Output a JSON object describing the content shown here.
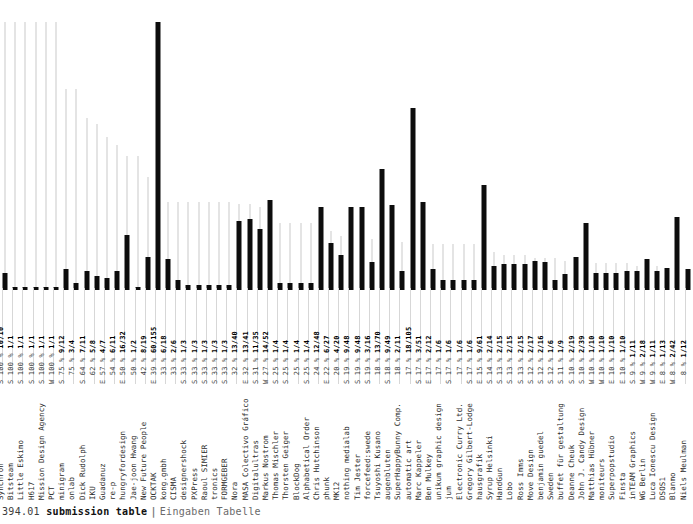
{
  "caption": {
    "number": "394.01",
    "title_en": "submission table",
    "separator": "|",
    "title_de": "Eingaben Tabelle"
  },
  "colors": {
    "bar_absolute": "#0d0d0d",
    "bar_percent": "#c9c9c9",
    "background": "#ffffff",
    "text": "#2b2b2b"
  },
  "chart_data": {
    "type": "bar",
    "xlabel": "",
    "ylabel": "",
    "grid": false,
    "legend": "none",
    "ylim_percent": [
      0,
      100
    ],
    "ylim_absolute": [
      0,
      155
    ],
    "series": [
      {
        "name": "acceptance percent",
        "unit": "%",
        "color": "#c9c9c9"
      },
      {
        "name": "submissions total",
        "unit": "count",
        "color": "#0d0d0d"
      }
    ],
    "categories": [
      "Synchron",
      "Bitsteam",
      "Little Eskimo",
      "H617",
      "Mission Design Agency",
      "PCT",
      "minigram",
      "onlab",
      "Dick Rudolph",
      "IKU",
      "Guadanuz",
      "re-p",
      "hungryfordesign",
      "Jae-joon Hwang",
      "New Future People",
      "OCKTAK",
      "kong.gmbh",
      "CISMA",
      "designershock",
      "PXPress",
      "Raoul SIMIER",
      "tronics",
      "FORMGEBER",
      "Nora",
      "MASA Colectivo Gráfico",
      "Digitalultras",
      "Markus Nostrom",
      "Thomas Mischler",
      "Thorsten Geiger",
      "BlockDog",
      "Alphabetical Order",
      "Chris Hutchinson",
      "phunk",
      "MK12",
      "nothing medialab",
      "Tim Jester",
      "forcefeed:swede",
      "Tsuyoshi Kusano",
      "augenbluten",
      "SuperHappyBunny Comp.",
      "automatic art",
      "Marc Kappeler",
      "Ben Mulkey",
      "unikum graphic design",
      "jum",
      "Electronic Curry Ltd.",
      "Gregory Gilbert-Lodge",
      "hausgrafik",
      "Syrup Helsinki",
      "HandGun",
      "Lobo",
      "Ross Imms",
      "Move Design",
      "benjamin guedel",
      "Sweden",
      "buffet für gestaltung",
      "Deanne Cheuk",
      "John J. Candy Design",
      "Matthias Hübner",
      "moniteurs",
      "Superpopstudio",
      "Finsta",
      "inTEAM Graphics",
      "WG Berlin",
      "Luca Ionescu Design",
      "DSOS1",
      "Blanmo",
      "Niels Meulman"
    ],
    "region": [
      "S",
      "S",
      "S",
      "S",
      "S",
      "W",
      "S",
      "",
      "S",
      "",
      "E",
      "",
      "E",
      "",
      "",
      "E",
      "",
      "",
      "S",
      "S",
      "S",
      "S",
      "",
      "E",
      "E",
      "S",
      "W",
      "S",
      "S",
      "",
      "E",
      "",
      "E",
      "S",
      "S",
      "S",
      "S",
      "",
      "S",
      "",
      "",
      "S",
      "E",
      "",
      "E",
      "",
      "S",
      "",
      "S",
      "W",
      "W",
      "E",
      "E",
      "S",
      "W",
      "W",
      "E",
      "W",
      "",
      "",
      "W",
      "E",
      "W",
      "",
      "S",
      "",
      "W"
    ],
    "percent": [
      100,
      100,
      100,
      100,
      100,
      100,
      75,
      75,
      64,
      62,
      57,
      54,
      50,
      50,
      42,
      39,
      33,
      33,
      33,
      33,
      33,
      33,
      33,
      32,
      32,
      31,
      27,
      25,
      25,
      25,
      25,
      24,
      22,
      20,
      19,
      19,
      19,
      18,
      18,
      18,
      17,
      17,
      17,
      17,
      17,
      17,
      17,
      15,
      14,
      13,
      13,
      13,
      12,
      12,
      12,
      11,
      10,
      10,
      10,
      10,
      10,
      10,
      9,
      9,
      9,
      8,
      8,
      8,
      8,
      6,
      6,
      5,
      5
    ],
    "accepted": [
      10,
      1,
      1,
      1,
      1,
      1,
      9,
      3,
      7,
      5,
      4,
      6,
      16,
      1,
      8,
      60,
      6,
      2,
      1,
      1,
      1,
      1,
      1,
      13,
      13,
      11,
      14,
      1,
      1,
      1,
      1,
      12,
      6,
      4,
      9,
      9,
      3,
      13,
      9,
      2,
      18,
      3,
      2,
      1,
      1,
      1,
      1,
      9,
      2,
      2,
      2,
      2,
      2,
      2,
      1,
      1,
      2,
      2,
      2,
      1,
      1,
      1,
      1,
      2,
      1,
      1,
      2,
      1,
      1,
      7,
      1,
      3,
      1
    ],
    "submitted": [
      10,
      1,
      1,
      1,
      1,
      1,
      12,
      4,
      11,
      8,
      7,
      11,
      32,
      2,
      19,
      155,
      18,
      6,
      3,
      3,
      3,
      3,
      3,
      40,
      41,
      35,
      52,
      4,
      4,
      4,
      4,
      48,
      27,
      20,
      48,
      48,
      16,
      70,
      49,
      11,
      105,
      51,
      12,
      6,
      6,
      6,
      6,
      61,
      14,
      15,
      15,
      15,
      17,
      16,
      6,
      9,
      19,
      39,
      10,
      10,
      10,
      11,
      11,
      18,
      11,
      13,
      42,
      12,
      12,
      13,
      12,
      12,
      112,
      18,
      61,
      21
    ],
    "values_text": [
      {
        "region": "S",
        "pct": "100 %",
        "frac": "10/10"
      },
      {
        "region": "S",
        "pct": "100 %",
        "frac": "1/1"
      },
      {
        "region": "S",
        "pct": "100 %",
        "frac": "1/1"
      },
      {
        "region": "S",
        "pct": "100 %",
        "frac": "1/1"
      },
      {
        "region": "S",
        "pct": "100 %",
        "frac": "1/1"
      },
      {
        "region": "W",
        "pct": "100 %",
        "frac": "1/1"
      },
      {
        "region": "S",
        "pct": "75 %",
        "frac": "9/12"
      },
      {
        "region": "",
        "pct": "75 %",
        "frac": "3/4"
      },
      {
        "region": "S",
        "pct": "64 %",
        "frac": "7/11"
      },
      {
        "region": "",
        "pct": "62 %",
        "frac": "5/8"
      },
      {
        "region": "E",
        "pct": "57 %",
        "frac": "4/7"
      },
      {
        "region": "",
        "pct": "54 %",
        "frac": "6/11"
      },
      {
        "region": "E",
        "pct": "50 %",
        "frac": "16/32"
      },
      {
        "region": "",
        "pct": "50 %",
        "frac": "1/2"
      },
      {
        "region": "",
        "pct": "42 %",
        "frac": "8/19"
      },
      {
        "region": "E",
        "pct": "39 %",
        "frac": "60/155"
      },
      {
        "region": "",
        "pct": "33 %",
        "frac": "6/18"
      },
      {
        "region": "",
        "pct": "33 %",
        "frac": "2/6"
      },
      {
        "region": "S",
        "pct": "33 %",
        "frac": "1/3"
      },
      {
        "region": "S",
        "pct": "33 %",
        "frac": "1/3"
      },
      {
        "region": "S",
        "pct": "33 %",
        "frac": "1/3"
      },
      {
        "region": "S",
        "pct": "33 %",
        "frac": "1/3"
      },
      {
        "region": "S",
        "pct": "33 %",
        "frac": "1/3"
      },
      {
        "region": "",
        "pct": "32 %",
        "frac": "13/40"
      },
      {
        "region": "E",
        "pct": "32 %",
        "frac": "13/41"
      },
      {
        "region": "S",
        "pct": "31 %",
        "frac": "11/35"
      },
      {
        "region": "W",
        "pct": "27 %",
        "frac": "14/52"
      },
      {
        "region": "S",
        "pct": "25 %",
        "frac": "1/4"
      },
      {
        "region": "S",
        "pct": "25 %",
        "frac": "1/4"
      },
      {
        "region": "",
        "pct": "25 %",
        "frac": "1/4"
      },
      {
        "region": "S",
        "pct": "25 %",
        "frac": "1/4"
      },
      {
        "region": "",
        "pct": "24 %",
        "frac": "12/48"
      },
      {
        "region": "E",
        "pct": "22 %",
        "frac": "6/27"
      },
      {
        "region": "",
        "pct": "20 %",
        "frac": "4/20"
      },
      {
        "region": "S",
        "pct": "19 %",
        "frac": "9/48"
      },
      {
        "region": "S",
        "pct": "19 %",
        "frac": "9/48"
      },
      {
        "region": "S",
        "pct": "19 %",
        "frac": "3/16"
      },
      {
        "region": "",
        "pct": "18 %",
        "frac": "13/70"
      },
      {
        "region": "S",
        "pct": "18 %",
        "frac": "9/49"
      },
      {
        "region": "",
        "pct": "18 %",
        "frac": "2/11"
      },
      {
        "region": "",
        "pct": "17 %",
        "frac": "18/105"
      },
      {
        "region": "S",
        "pct": "17 %",
        "frac": "3/51"
      },
      {
        "region": "E",
        "pct": "17 %",
        "frac": "2/12"
      },
      {
        "region": "",
        "pct": "17 %",
        "frac": "1/6"
      },
      {
        "region": "S",
        "pct": "17 %",
        "frac": "1/6"
      },
      {
        "region": "",
        "pct": "17 %",
        "frac": "1/6"
      },
      {
        "region": "S",
        "pct": "17 %",
        "frac": "1/6"
      },
      {
        "region": "E",
        "pct": "15 %",
        "frac": "9/61"
      },
      {
        "region": "S",
        "pct": "14 %",
        "frac": "2/14"
      },
      {
        "region": "S",
        "pct": "13 %",
        "frac": "2/15"
      },
      {
        "region": "S",
        "pct": "13 %",
        "frac": "2/15"
      },
      {
        "region": "S",
        "pct": "13 %",
        "frac": "2/15"
      },
      {
        "region": "S",
        "pct": "12 %",
        "frac": "2/17"
      },
      {
        "region": "S",
        "pct": "12 %",
        "frac": "2/16"
      },
      {
        "region": "S",
        "pct": "12 %",
        "frac": "1/6"
      },
      {
        "region": "S",
        "pct": "11 %",
        "frac": "1/9"
      },
      {
        "region": "S",
        "pct": "10 %",
        "frac": "2/19"
      },
      {
        "region": "S",
        "pct": "10 %",
        "frac": "2/39"
      },
      {
        "region": "W",
        "pct": "10 %",
        "frac": "1/10"
      },
      {
        "region": "W",
        "pct": "10 %",
        "frac": "1/10"
      },
      {
        "region": "E",
        "pct": "10 %",
        "frac": "1/10"
      },
      {
        "region": "E",
        "pct": "10 %",
        "frac": "1/10"
      },
      {
        "region": "S",
        "pct": "9 %",
        "frac": "1/11"
      },
      {
        "region": "W",
        "pct": "9 %",
        "frac": "2/18"
      },
      {
        "region": "W",
        "pct": "9 %",
        "frac": "1/11"
      },
      {
        "region": "E",
        "pct": "8 %",
        "frac": "1/13"
      },
      {
        "region": "W",
        "pct": "8 %",
        "frac": "2/42"
      },
      {
        "region": "",
        "pct": "8 %",
        "frac": "1/12"
      },
      {
        "region": "W",
        "pct": "8 %",
        "frac": "1/13"
      },
      {
        "region": "E",
        "pct": "8 %",
        "frac": "1/12"
      },
      {
        "region": "W",
        "pct": "6 %",
        "frac": "7/112"
      },
      {
        "region": "",
        "pct": "6 %",
        "frac": "1/18"
      },
      {
        "region": "S",
        "pct": "5 %",
        "frac": "3/61"
      },
      {
        "region": "W",
        "pct": "5 %",
        "frac": "1/21"
      }
    ]
  }
}
